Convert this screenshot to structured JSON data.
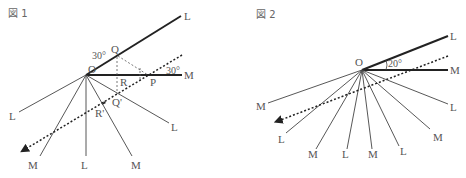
{
  "figure1": {
    "title": "図 1",
    "origin_label": "O",
    "top_line_label": "L",
    "horizontal_line_label": "M",
    "angle_top_label": "30°",
    "angle_right_label": "30°",
    "points": [
      "Q",
      "R",
      "P",
      "R'",
      "Q'"
    ],
    "fan_labels": [
      "L",
      "M",
      "L",
      "M",
      "L"
    ]
  },
  "figure2": {
    "title": "図 2",
    "origin_label": "O",
    "top_line_label": "L",
    "horizontal_line_label": "M",
    "angle_label": "20°",
    "fan_labels": [
      "M",
      "L",
      "M",
      "L",
      "M",
      "L",
      "M",
      "L"
    ]
  },
  "colors": {
    "line": "#333333",
    "label": "#555555"
  }
}
